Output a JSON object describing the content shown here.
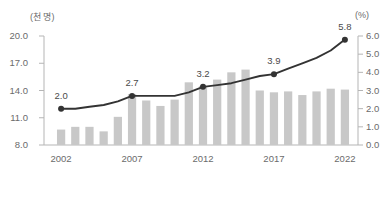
{
  "chart_data": {
    "type": "bar",
    "title": "",
    "xlabel": "",
    "ylabel": "(천 명)",
    "y2label": "(%)",
    "categories": [
      "2002",
      "2003",
      "2004",
      "2005",
      "2006",
      "2007",
      "2008",
      "2009",
      "2010",
      "2011",
      "2012",
      "2013",
      "2014",
      "2015",
      "2016",
      "2017",
      "2018",
      "2019",
      "2020",
      "2021",
      "2022"
    ],
    "x_tick_labels": [
      "2002",
      "2007",
      "2012",
      "2017",
      "2022"
    ],
    "grid": false,
    "legend": "none",
    "ylim": [
      8.0,
      20.0
    ],
    "y_ticks": [
      "8.0",
      "11.0",
      "14.0",
      "17.0",
      "20.0"
    ],
    "y2lim": [
      0.0,
      6.0
    ],
    "y2_ticks": [
      "0.0",
      "1.0",
      "2.0",
      "3.0",
      "4.0",
      "5.0",
      "6.0"
    ],
    "series": [
      {
        "name": "인원",
        "type": "bar",
        "axis": "left",
        "unit": "천 명",
        "color": "#c8c8c8",
        "values": [
          9.7,
          10.0,
          10.0,
          9.5,
          11.1,
          13.6,
          12.9,
          12.3,
          13.0,
          14.9,
          14.5,
          15.2,
          16.0,
          16.3,
          14.0,
          13.8,
          13.9,
          13.5,
          13.9,
          14.2,
          14.1
        ]
      },
      {
        "name": "비율",
        "type": "line",
        "axis": "right",
        "unit": "%",
        "color": "#333333",
        "values": [
          2.0,
          2.0,
          2.1,
          2.2,
          2.4,
          2.7,
          2.7,
          2.7,
          2.7,
          2.9,
          3.2,
          3.3,
          3.4,
          3.6,
          3.8,
          3.9,
          4.2,
          4.5,
          4.8,
          5.2,
          5.8
        ]
      }
    ],
    "point_labels": [
      {
        "category": "2002",
        "value": "2.0"
      },
      {
        "category": "2007",
        "value": "2.7"
      },
      {
        "category": "2012",
        "value": "3.2"
      },
      {
        "category": "2017",
        "value": "3.9"
      },
      {
        "category": "2022",
        "value": "5.8"
      }
    ]
  }
}
